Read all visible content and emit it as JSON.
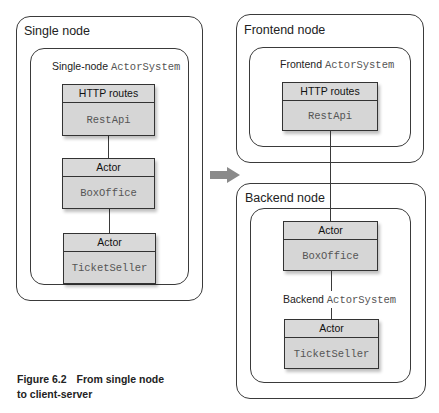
{
  "left": {
    "node_label": "Single node",
    "system_label_prefix": "Single-node",
    "system_label_code": "ActorSystem",
    "components": [
      {
        "header": "HTTP routes",
        "name": "RestApi"
      },
      {
        "header": "Actor",
        "name": "BoxOffice"
      },
      {
        "header": "Actor",
        "name": "TicketSeller"
      }
    ]
  },
  "right": {
    "frontend": {
      "node_label": "Frontend node",
      "system_label_prefix": "Frontend",
      "system_label_code": "ActorSystem",
      "components": [
        {
          "header": "HTTP routes",
          "name": "RestApi"
        }
      ]
    },
    "backend": {
      "node_label": "Backend node",
      "system_label_prefix": "Backend",
      "system_label_code": "ActorSystem",
      "components": [
        {
          "header": "Actor",
          "name": "BoxOffice"
        },
        {
          "header": "Actor",
          "name": "TicketSeller"
        }
      ]
    }
  },
  "arrow": {
    "icon": "right-arrow-icon",
    "color": "#8a8a8a"
  },
  "caption": {
    "number": "Figure 6.2",
    "line1": "From single node",
    "line2": "to client-server"
  }
}
